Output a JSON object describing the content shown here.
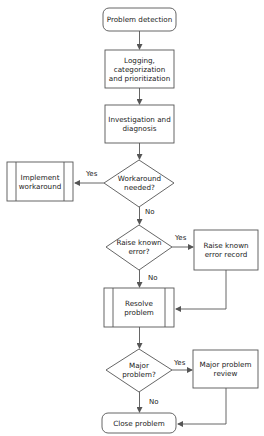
{
  "diagram": {
    "type": "flowchart",
    "colors": {
      "stroke": "#555555",
      "fill": "#ffffff",
      "text": "#222222"
    },
    "nodes": [
      {
        "id": "detect",
        "shape": "rounded-rect",
        "label": "Problem detection"
      },
      {
        "id": "logging",
        "shape": "rect",
        "label": "Logging, categorization and prioritization"
      },
      {
        "id": "investigate",
        "shape": "rect",
        "label": "Investigation and diagnosis"
      },
      {
        "id": "workaround_q",
        "shape": "diamond",
        "label": "Workaround needed?"
      },
      {
        "id": "implement",
        "shape": "predefined-process",
        "label": "Implement workaround"
      },
      {
        "id": "known_error_q",
        "shape": "diamond",
        "label": "Raise known error?"
      },
      {
        "id": "known_error_rec",
        "shape": "rect",
        "label": "Raise known error record"
      },
      {
        "id": "resolve",
        "shape": "predefined-process",
        "label": "Resolve problem"
      },
      {
        "id": "major_q",
        "shape": "diamond",
        "label": "Major problem?"
      },
      {
        "id": "major_review",
        "shape": "rect",
        "label": "Major problem review"
      },
      {
        "id": "close",
        "shape": "rounded-rect",
        "label": "Close problem"
      }
    ],
    "edges": [
      {
        "from": "detect",
        "to": "logging",
        "label": ""
      },
      {
        "from": "logging",
        "to": "investigate",
        "label": ""
      },
      {
        "from": "investigate",
        "to": "workaround_q",
        "label": ""
      },
      {
        "from": "workaround_q",
        "to": "implement",
        "label": "Yes"
      },
      {
        "from": "workaround_q",
        "to": "known_error_q",
        "label": "No"
      },
      {
        "from": "known_error_q",
        "to": "known_error_rec",
        "label": "Yes"
      },
      {
        "from": "known_error_q",
        "to": "resolve",
        "label": "No"
      },
      {
        "from": "known_error_rec",
        "to": "resolve",
        "label": ""
      },
      {
        "from": "resolve",
        "to": "major_q",
        "label": ""
      },
      {
        "from": "major_q",
        "to": "major_review",
        "label": "Yes"
      },
      {
        "from": "major_q",
        "to": "close",
        "label": "No"
      },
      {
        "from": "major_review",
        "to": "close",
        "label": ""
      }
    ]
  }
}
